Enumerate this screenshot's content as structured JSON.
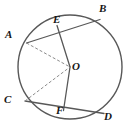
{
  "figure": {
    "type": "geometry-diagram",
    "width": 129,
    "height": 130,
    "background_color": "#ffffff",
    "stroke_color": "#4a4a4a",
    "label_color": "#161616"
  },
  "circle": {
    "name": "main-circle",
    "center_x": 70,
    "center_y": 67,
    "radius": 52,
    "stroke_color": "#585858",
    "stroke_width": 1.4,
    "fill": "none"
  },
  "points": [
    {
      "id": "A",
      "label": "A",
      "x": 26.5,
      "y": 43.0,
      "label_x": 5,
      "label_y": 29
    },
    {
      "id": "B",
      "label": "B",
      "x": 100.0,
      "y": 19.5,
      "label_x": 99,
      "label_y": 3
    },
    {
      "id": "C",
      "label": "C",
      "x": 25.0,
      "y": 101.0,
      "label_x": 4,
      "label_y": 94
    },
    {
      "id": "D",
      "label": "D",
      "x": 104.0,
      "y": 113.5,
      "label_x": 104,
      "label_y": 111
    },
    {
      "id": "E",
      "label": "E",
      "x": 57.0,
      "y": 25.5,
      "label_x": 53,
      "label_y": 14
    },
    {
      "id": "F",
      "label": "F",
      "x": 63.5,
      "y": 110.5,
      "label_x": 56,
      "label_y": 105
    },
    {
      "id": "O",
      "label": "O",
      "x": 70.0,
      "y": 67.0,
      "label_x": 72,
      "label_y": 61
    }
  ],
  "segments": [
    {
      "id": "chord-AB",
      "from": "A",
      "to": "B",
      "style": "solid",
      "stroke_color": "#585858",
      "stroke_width": 1.3
    },
    {
      "id": "chord-CD",
      "from": "C",
      "to": "D",
      "style": "solid",
      "stroke_color": "#585858",
      "stroke_width": 1.3
    },
    {
      "id": "radius-EO",
      "from": "E",
      "to": "O",
      "style": "solid",
      "stroke_color": "#585858",
      "stroke_width": 1.3
    },
    {
      "id": "radius-OF",
      "from": "O",
      "to": "F",
      "style": "solid",
      "stroke_color": "#585858",
      "stroke_width": 1.3
    },
    {
      "id": "radius-AO",
      "from": "A",
      "to": "O",
      "style": "dashed",
      "stroke_color": "#8c8c8c",
      "stroke_width": 1.0,
      "dash": "3,2"
    },
    {
      "id": "radius-CO",
      "from": "C",
      "to": "O",
      "style": "dashed",
      "stroke_color": "#8c8c8c",
      "stroke_width": 1.0,
      "dash": "3,2"
    }
  ]
}
